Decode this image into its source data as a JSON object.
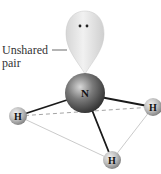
{
  "diagram": {
    "molecule": "NH3",
    "central_atom": {
      "symbol": "N"
    },
    "hydrogens": [
      {
        "symbol": "H",
        "position": "left"
      },
      {
        "symbol": "H",
        "position": "right"
      },
      {
        "symbol": "H",
        "position": "bottom"
      }
    ],
    "lone_pair": {
      "label_line1": "Unshared",
      "label_line2": "pair",
      "electron_dots": ":"
    },
    "colors": {
      "nitrogen": "#5a5a5a",
      "hydrogen": "#b8b8b8",
      "lone_pair_lobe": "#e6e6e6",
      "bond": "#1a1a1a",
      "triangle_edge": "#bdbdbd",
      "dashed_edge": "#999999"
    }
  }
}
